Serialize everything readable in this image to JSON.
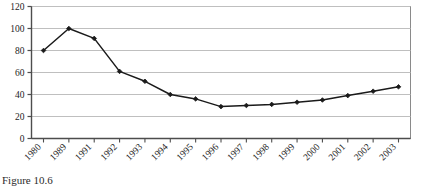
{
  "figure": {
    "caption": "Figure 10.6"
  },
  "chart_data": {
    "type": "line",
    "title": "",
    "xlabel": "",
    "ylabel": "",
    "categories": [
      "1980",
      "1989",
      "1991",
      "1992",
      "1993",
      "1994",
      "1995",
      "1996",
      "1997",
      "1998",
      "1999",
      "2000",
      "2001",
      "2002",
      "2003"
    ],
    "values": [
      80,
      100,
      91,
      61,
      52,
      40,
      36,
      29,
      30,
      31,
      33,
      35,
      39,
      43,
      47
    ],
    "series": [
      {
        "name": "series-1",
        "values": [
          80,
          100,
          91,
          61,
          52,
          40,
          36,
          29,
          30,
          31,
          33,
          35,
          39,
          43,
          47
        ],
        "color": "#1a1a1a",
        "marker": "diamond"
      }
    ],
    "ylim": [
      0,
      120
    ],
    "yticks": [
      0,
      20,
      40,
      60,
      80,
      100,
      120
    ],
    "ytick_labels": [
      "0",
      "20",
      "40",
      "60",
      "80",
      "100",
      "120"
    ],
    "grid": "horizontal",
    "grid_color": "#bfbfbf",
    "legend": "none",
    "plot_border_color": "#808080",
    "axis_color": "#4d4d4d",
    "background": "#ffffff",
    "xtick_label_rotation": -45
  }
}
